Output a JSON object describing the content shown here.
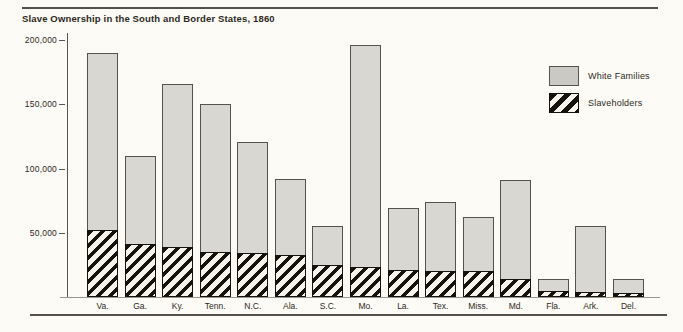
{
  "title": "Slave Ownership in the South and Border States, 1860",
  "legend": {
    "white_families_label": "White Families",
    "slaveholders_label": "Slaveholders"
  },
  "colors": {
    "background": "#fcfbf6",
    "text": "#2e2921",
    "rule": "#55514a",
    "bar_fill": "#d9d7d1",
    "bar_border": "#57534a",
    "legend_gray": "#cbc9c3",
    "hatch_dark": "#16130f",
    "hatch_light": "#f5f3ea"
  },
  "y_axis": {
    "tick_labels": [
      "200,000",
      "150,000",
      "100,000",
      "50,000"
    ],
    "tick_values": [
      200000,
      150000,
      100000,
      50000
    ]
  },
  "chart_data": {
    "type": "bar",
    "title": "Slave Ownership in the South and Border States, 1860",
    "categories": [
      "Va.",
      "Ga.",
      "Ky.",
      "Tenn.",
      "N.C.",
      "Ala.",
      "S.C.",
      "Mo.",
      "La.",
      "Tex.",
      "Miss.",
      "Md.",
      "Fla.",
      "Ark.",
      "Del."
    ],
    "series": [
      {
        "name": "White Families",
        "style": "solid-gray-full-bar",
        "values": [
          190000,
          110000,
          166000,
          150000,
          121000,
          92000,
          55000,
          196000,
          69000,
          74000,
          62000,
          91000,
          14000,
          55000,
          14000
        ]
      },
      {
        "name": "Slaveholders",
        "style": "hatched-overlay-at-base",
        "values": [
          52000,
          41000,
          39000,
          35000,
          34000,
          33000,
          25000,
          23000,
          21000,
          20000,
          20000,
          14000,
          5000,
          4000,
          3000
        ]
      }
    ],
    "xlabel": "",
    "ylabel": "",
    "ylim": [
      0,
      200000
    ],
    "grid": false,
    "legend_position": "upper-right"
  }
}
